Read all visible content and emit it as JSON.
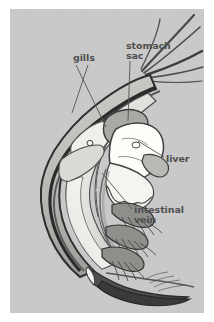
{
  "figure": {
    "background_color": "#ffffff",
    "panel_color": "#c9c9c9",
    "ink_color": "#3a3a3a",
    "label_color": "#4f4f4f"
  },
  "labels": {
    "gills": "gills",
    "stomach_sac": "stomach\nsac",
    "liver": "liver",
    "intestinal_vein": "intestinal\nvein"
  },
  "anatomy_parts": [
    {
      "name": "gills",
      "label": "gills"
    },
    {
      "name": "stomach-sac",
      "label": "stomach sac"
    },
    {
      "name": "liver",
      "label": "liver"
    },
    {
      "name": "intestinal-vein",
      "label": "intestinal vein"
    }
  ]
}
